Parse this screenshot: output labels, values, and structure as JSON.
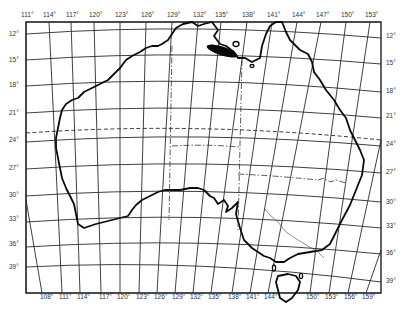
{
  "map": {
    "title": "Australia graticule map",
    "projection_note": "Conic-style graticule, 3-degree spacing",
    "top_longitude_labels": [
      "111°",
      "114°",
      "117°",
      "120°",
      "123°",
      "126°",
      "129°",
      "132°",
      "135°",
      "138°",
      "141°",
      "144°",
      "147°",
      "150°",
      "153°"
    ],
    "bottom_longitude_labels": [
      "108°",
      "111°",
      "114°",
      "117°",
      "120°",
      "123°",
      "126°",
      "129°",
      "132°",
      "135°",
      "138°",
      "141°",
      "144°",
      "150°",
      "153°",
      "156°",
      "159°"
    ],
    "left_latitude_labels": [
      "12°",
      "15°",
      "18°",
      "21°",
      "24°",
      "27°",
      "30°",
      "33°",
      "36°",
      "39°"
    ],
    "right_latitude_labels": [
      "12°",
      "15°",
      "18°",
      "21°",
      "24°",
      "27°",
      "30°",
      "33°",
      "36°",
      "39°"
    ],
    "features": {
      "highlighted_region": "Elongated dark shaded area in northern Northern Territory near 132°–135°E, 14°–15°S",
      "tropic_line": "Dashed line near 23.5°S (Tropic of Capricorn)",
      "state_borders": "Dash-dot lines marking internal borders",
      "tasmania": "Island south-east of mainland"
    },
    "colors": {
      "background": "#ffffff",
      "lines": "#111111",
      "labels": "#333333",
      "highlight": "#0a0a0a"
    }
  }
}
